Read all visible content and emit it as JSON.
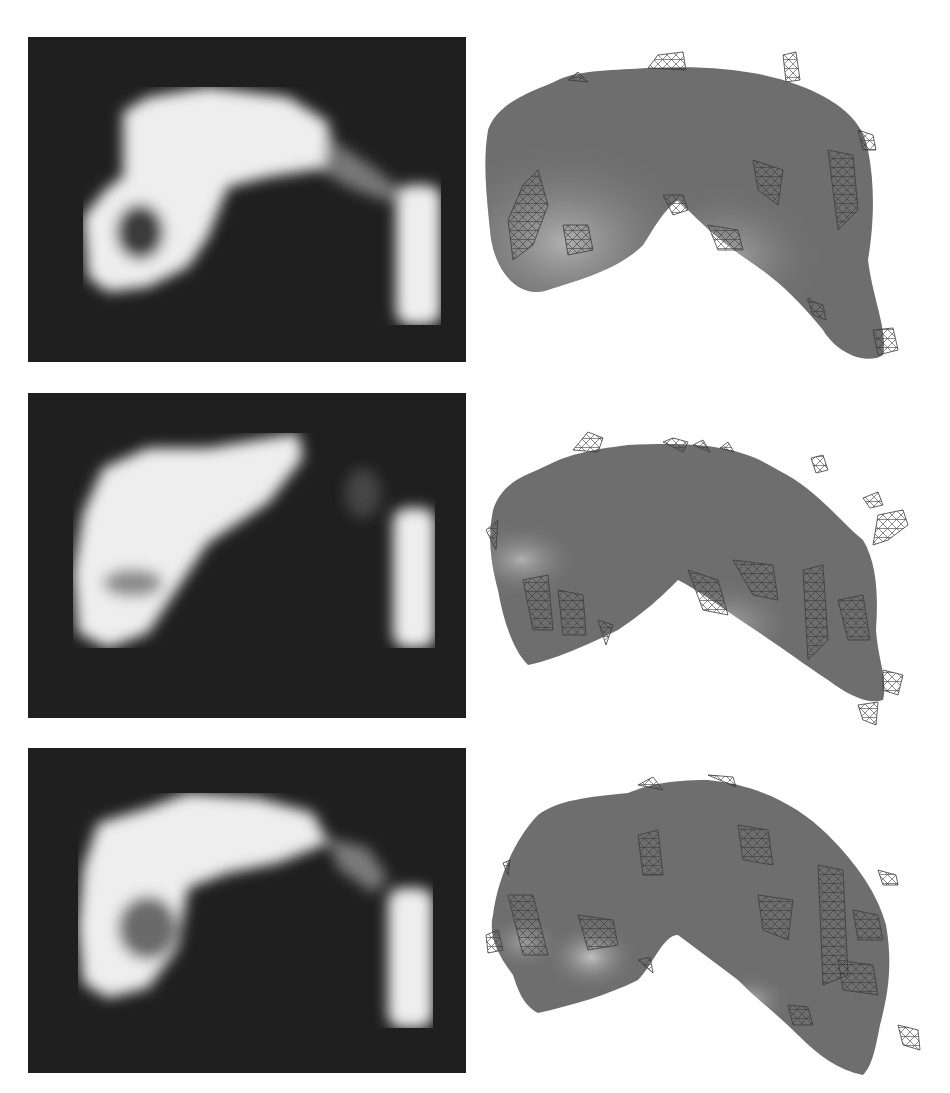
{
  "figure": {
    "layout": {
      "rows": 3,
      "columns": 2
    },
    "colors": {
      "page_background": "#ffffff",
      "mri_background": "#1f1f1f",
      "mri_tissue_bright": "#ededed",
      "mri_tissue_mid": "#8a8a8a",
      "mri_tissue_dark": "#3a3a3a",
      "surface_fill": "#6e6e6e",
      "surface_highlight": "#a8a8a8",
      "wireframe": "#3c3c3c"
    },
    "rows": [
      {
        "mri_slice": {
          "description": "Pixelated grayscale MRI slice showing bright arch-shaped structure with dark cavity on left and vertical bar on right"
        },
        "surface_render": {
          "description": "3D shaded surface rendering with overlaid wireframe mesh of arch-shaped object"
        }
      },
      {
        "mri_slice": {
          "description": "Pixelated grayscale MRI slice showing diagonal bright blob with small gray spot, separate vertical bright bar on right"
        },
        "surface_render": {
          "description": "3D shaded surface rendering with overlaid wireframe mesh, small detached mesh fragments at upper right"
        }
      },
      {
        "mri_slice": {
          "description": "Pixelated grayscale MRI slice showing bright arch with darker inner region at lower left and vertical bar on right"
        },
        "surface_render": {
          "description": "3D shaded surface rendering with overlaid wireframe mesh of crescent-shaped object"
        }
      }
    ]
  }
}
